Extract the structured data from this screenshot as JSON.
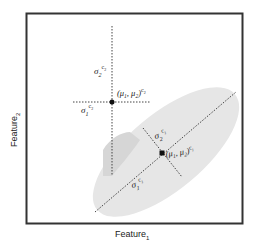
{
  "diagram": {
    "axes": {
      "x_label": "Feature",
      "x_sub": "1",
      "y_label": "Feature",
      "y_sub": "2"
    },
    "clusters": [
      {
        "id": "c2",
        "mean_label": "(μ",
        "mean_sub1": "1",
        "mean_mid": ", μ",
        "mean_sub2": "2",
        "mean_close": ")",
        "mean_sup": "c",
        "mean_sup_sub": "2",
        "sigma1": "σ",
        "sigma1_sub": "1",
        "sigma1_sup": "c",
        "sigma1_sup_sub": "2",
        "sigma2": "σ",
        "sigma2_sub": "2",
        "sigma2_sup": "c",
        "sigma2_sup_sub": "2"
      },
      {
        "id": "c1",
        "mean_label": "(μ",
        "mean_sub1": "1",
        "mean_mid": ", μ",
        "mean_sub2": "2",
        "mean_close": ")",
        "mean_sup": "c",
        "mean_sup_sub": "1",
        "sigma1": "σ",
        "sigma1_sub": "1",
        "sigma1_sup": "c",
        "sigma1_sup_sub": "1",
        "sigma2": "σ",
        "sigma2_sub": "2",
        "sigma2_sup": "c",
        "sigma2_sup_sub": "1"
      }
    ],
    "colors": {
      "frame": "#333333",
      "ellipse": "#e6e6e6",
      "overlap": "#d4d4d4",
      "line": "#444444"
    }
  }
}
